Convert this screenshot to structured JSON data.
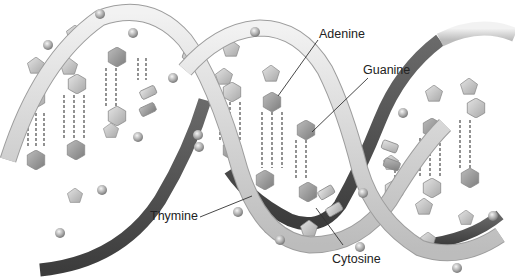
{
  "figure": {
    "labels": [
      {
        "id": "adenine",
        "text": "Adenine",
        "x": 319,
        "y": 28,
        "line": [
          [
            318,
            40
          ],
          [
            278,
            96
          ]
        ]
      },
      {
        "id": "guanine",
        "text": "Guanine",
        "x": 363,
        "y": 64,
        "line": [
          [
            368,
            78
          ],
          [
            312,
            132
          ]
        ]
      },
      {
        "id": "thymine",
        "text": "Thymine",
        "x": 150,
        "y": 210,
        "line": [
          [
            200,
            217
          ],
          [
            252,
            196
          ]
        ]
      },
      {
        "id": "cytosine",
        "text": "Cytosine",
        "x": 332,
        "y": 253,
        "line": [
          [
            343,
            245
          ],
          [
            316,
            208
          ]
        ]
      }
    ]
  },
  "colors": {
    "background": "#ffffff",
    "backbone_light": "#e6e6e6",
    "backbone_mid": "#c9c9c9",
    "backbone_dark": "#4d4d4d",
    "base_light": "#d8d8d8",
    "base_dark": "#9a9a9a",
    "hbond": "#777777",
    "phosphate": "#a8a8a8",
    "leader_line": "#333333",
    "text": "#222222"
  }
}
